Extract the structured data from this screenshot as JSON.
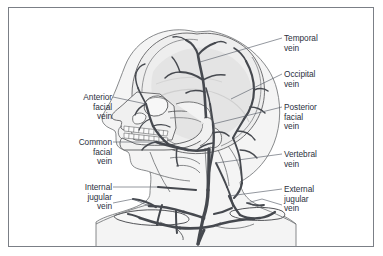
{
  "figure": {
    "type": "anatomical-diagram",
    "width": 383,
    "height": 256,
    "background_color": "#ffffff",
    "border_color": "#7b7f86",
    "label_text_color": "#2b3140",
    "leader_line_color": "#5a606b",
    "vein_color": "#4b4f56",
    "bone_fill_color": "#f1f1f1",
    "bone_outline_color": "#58595b"
  },
  "labels": {
    "left": [
      {
        "id": "anterior-facial-vein",
        "text": "Anterior\nfacial\nvein",
        "x": 60,
        "y": 93,
        "width": 52
      },
      {
        "id": "common-facial-vein",
        "text": "Common\nfacial\nvein",
        "x": 56,
        "y": 138,
        "width": 56
      },
      {
        "id": "internal-jugular-vein",
        "text": "Internal\njugular\nvein",
        "x": 60,
        "y": 183,
        "width": 52
      }
    ],
    "right": [
      {
        "id": "temporal-vein",
        "text": "Temporal\nvein",
        "x": 284,
        "y": 34,
        "width": 66
      },
      {
        "id": "occipital-vein",
        "text": "Occipital\nvein",
        "x": 284,
        "y": 70,
        "width": 66
      },
      {
        "id": "posterior-facial-vein",
        "text": "Posterior\nfacial\nvein",
        "x": 284,
        "y": 103,
        "width": 66
      },
      {
        "id": "vertebral-vein",
        "text": "Vertebral\nvein",
        "x": 284,
        "y": 150,
        "width": 66
      },
      {
        "id": "external-jugular-vein",
        "text": "External\njugular\nvein",
        "x": 284,
        "y": 185,
        "width": 66
      }
    ]
  },
  "leader_lines": [
    {
      "id": "leader-temporal-vein",
      "points": "282,38 200,62"
    },
    {
      "id": "leader-occipital-vein",
      "points": "282,74 231,99"
    },
    {
      "id": "leader-posterior-facial-vein",
      "points": "282,107 213,124"
    },
    {
      "id": "leader-vertebral-vein",
      "points": "282,154 216,163"
    },
    {
      "id": "leader-external-jugular-vein",
      "points": "282,189 229,196"
    },
    {
      "id": "leader-external-jugular-vein-2",
      "points": "282,205 262,199 247,203"
    },
    {
      "id": "leader-anterior-facial-vein",
      "points": "113,97 146,104"
    },
    {
      "id": "leader-common-facial-vein",
      "points": "113,142 156,142"
    },
    {
      "id": "leader-internal-jugular-vein",
      "points": "113,187 158,187"
    },
    {
      "id": "leader-internal-jugular-vein-2",
      "points": "113,203 133,199 149,206"
    }
  ]
}
